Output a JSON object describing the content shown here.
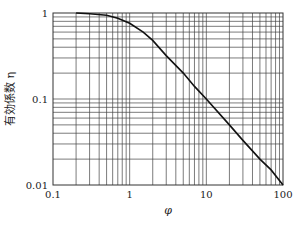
{
  "chart_data": {
    "type": "line",
    "title": "",
    "xlabel": "φ",
    "ylabel": "有効係数 η",
    "xscale": "log",
    "yscale": "log",
    "xlim": [
      0.1,
      100
    ],
    "ylim": [
      0.01,
      1
    ],
    "x_ticks": [
      "0.1",
      "1",
      "10",
      "100"
    ],
    "y_ticks": [
      "0.01",
      "0.1",
      "1"
    ],
    "grid": true,
    "legend": null,
    "series": [
      {
        "name": "η vs φ",
        "x": [
          0.2,
          0.3,
          0.5,
          0.7,
          1,
          1.5,
          2,
          3,
          5,
          7,
          10,
          20,
          30,
          50,
          70,
          100
        ],
        "y": [
          1.0,
          0.98,
          0.94,
          0.87,
          0.76,
          0.6,
          0.48,
          0.32,
          0.2,
          0.14,
          0.1,
          0.05,
          0.033,
          0.02,
          0.015,
          0.01
        ]
      }
    ]
  },
  "axes": {
    "xlabel": "φ",
    "ylabel": "有効係数 η",
    "x_ticks": [
      {
        "value": 0.1,
        "label": "0.1"
      },
      {
        "value": 1,
        "label": "1"
      },
      {
        "value": 10,
        "label": "10"
      },
      {
        "value": 100,
        "label": "100"
      }
    ],
    "y_ticks": [
      {
        "value": 0.01,
        "label": "0.01"
      },
      {
        "value": 0.1,
        "label": "0.1"
      },
      {
        "value": 1,
        "label": "1"
      }
    ]
  },
  "colors": {
    "grid": "#444444",
    "curve": "#111111",
    "text": "#222222",
    "background": "#ffffff"
  }
}
